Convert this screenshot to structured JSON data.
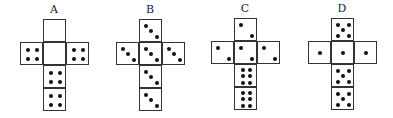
{
  "nets": [
    {
      "label": "A",
      "faces": {
        "top": 0,
        "left": 4,
        "center": 0,
        "right": 4,
        "below1": 4,
        "below2": 4
      }
    },
    {
      "label": "B",
      "faces": {
        "top": 3,
        "left": 3,
        "center": 3,
        "right": 3,
        "below1": 3,
        "below2": 3
      }
    },
    {
      "label": "C",
      "faces": {
        "top": 2,
        "left": 2,
        "center": 2,
        "right": 2,
        "below1": 6,
        "below2": 6
      }
    },
    {
      "label": "D",
      "faces": {
        "top": 5,
        "left": 1,
        "center": 1,
        "right": 1,
        "below1": 5,
        "below2": 5
      }
    }
  ]
}
